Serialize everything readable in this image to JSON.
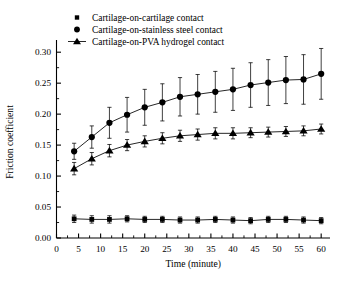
{
  "chart_data": {
    "type": "line",
    "title": "",
    "xlabel": "Time (minute)",
    "ylabel": "Friction coefficient",
    "xlim": [
      0,
      62
    ],
    "ylim": [
      0.0,
      0.31
    ],
    "xticks": [
      0,
      5,
      10,
      15,
      20,
      25,
      30,
      35,
      40,
      45,
      50,
      55,
      60
    ],
    "xtick_labels": [
      "0",
      "5",
      "10",
      "15",
      "20",
      "25",
      "30",
      "35",
      "40",
      "45",
      "50",
      "55",
      "60"
    ],
    "yticks": [
      0.0,
      0.05,
      0.1,
      0.15,
      0.2,
      0.25,
      0.3
    ],
    "ytick_labels": [
      "0.00",
      "0.05",
      "0.10",
      "0.15",
      "0.20",
      "0.25",
      "0.30"
    ],
    "grid": false,
    "legend_position": "top-left",
    "x": [
      4,
      8,
      12,
      16,
      20,
      24,
      28,
      32,
      36,
      40,
      44,
      48,
      52,
      56,
      60
    ],
    "series": [
      {
        "name": "Cartilage-on-cartilage contact",
        "marker": "square",
        "values": [
          0.031,
          0.03,
          0.03,
          0.031,
          0.03,
          0.03,
          0.029,
          0.029,
          0.03,
          0.029,
          0.028,
          0.03,
          0.03,
          0.029,
          0.028
        ],
        "errors": [
          0.006,
          0.006,
          0.006,
          0.005,
          0.005,
          0.005,
          0.005,
          0.005,
          0.005,
          0.005,
          0.005,
          0.005,
          0.005,
          0.005,
          0.005
        ]
      },
      {
        "name": "Cartilage-on-stainless steel contact",
        "marker": "circle",
        "values": [
          0.14,
          0.163,
          0.186,
          0.199,
          0.211,
          0.219,
          0.228,
          0.232,
          0.236,
          0.24,
          0.247,
          0.251,
          0.255,
          0.256,
          0.265
        ],
        "errors": [
          0.013,
          0.018,
          0.025,
          0.028,
          0.029,
          0.03,
          0.031,
          0.032,
          0.033,
          0.034,
          0.036,
          0.037,
          0.038,
          0.04,
          0.041
        ]
      },
      {
        "name": "Cartilage-on-PVA hydrogel contact",
        "marker": "triangle",
        "values": [
          0.112,
          0.128,
          0.141,
          0.15,
          0.156,
          0.161,
          0.165,
          0.167,
          0.169,
          0.169,
          0.17,
          0.171,
          0.172,
          0.173,
          0.176
        ],
        "errors": [
          0.01,
          0.01,
          0.01,
          0.009,
          0.009,
          0.009,
          0.009,
          0.009,
          0.009,
          0.009,
          0.008,
          0.008,
          0.008,
          0.008,
          0.008
        ]
      }
    ]
  },
  "legend": {
    "items": [
      {
        "label": "Cartilage-on-cartilage contact",
        "marker": "square"
      },
      {
        "label": "Cartilage-on-stainless steel contact",
        "marker": "circle"
      },
      {
        "label": "Cartilage-on-PVA hydrogel contact",
        "marker": "triangle"
      }
    ]
  }
}
